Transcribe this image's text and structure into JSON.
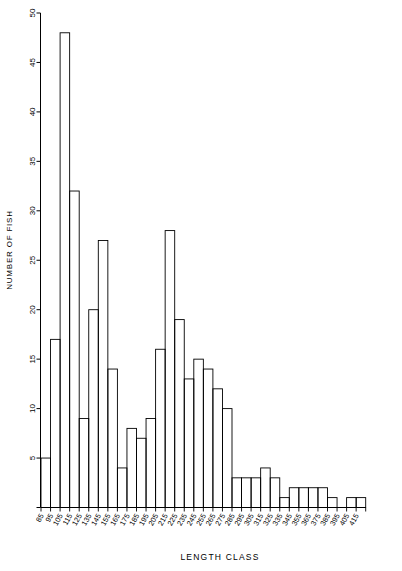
{
  "chart_data": {
    "type": "bar",
    "title": "",
    "xlabel": "LENGTH CLASS",
    "ylabel": "NUMBER OF FISH",
    "ylim": [
      0,
      50
    ],
    "y_ticks": [
      0,
      5,
      10,
      15,
      20,
      25,
      30,
      35,
      40,
      45,
      50
    ],
    "y_tick_labels": [
      "",
      "5",
      "10",
      "15",
      "20",
      "25",
      "30",
      "35",
      "40",
      "45",
      "50"
    ],
    "grid": false,
    "legend": false,
    "categories": [
      "85",
      "95",
      "105",
      "115",
      "125",
      "135",
      "145",
      "155",
      "165",
      "175",
      "185",
      "195",
      "205",
      "215",
      "225",
      "235",
      "245",
      "255",
      "265",
      "275",
      "285",
      "295",
      "305",
      "315",
      "325",
      "335",
      "345",
      "355",
      "365",
      "375",
      "385",
      "395",
      "405",
      "415"
    ],
    "values": [
      5,
      17,
      48,
      32,
      9,
      20,
      27,
      14,
      4,
      8,
      7,
      9,
      16,
      28,
      19,
      13,
      15,
      14,
      12,
      10,
      3,
      3,
      3,
      4,
      3,
      1,
      2,
      2,
      2,
      2,
      1,
      0,
      1,
      1
    ]
  },
  "axes": {
    "y_axis_name": "number-of-fish-axis",
    "x_axis_name": "length-class-axis"
  }
}
